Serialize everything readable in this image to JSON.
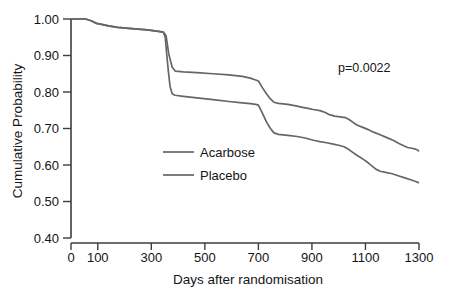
{
  "chart_data": {
    "type": "line",
    "title": "",
    "xlabel": "Days after randomisation",
    "ylabel": "Cumulative Probability",
    "xlim": [
      0,
      1300
    ],
    "ylim": [
      0.4,
      1.0
    ],
    "grid": false,
    "legend_position": "center-left-inside",
    "x_ticks": [
      0,
      100,
      300,
      500,
      700,
      900,
      1100,
      1300
    ],
    "x_tick_labels": [
      "0",
      "100",
      "300",
      "500",
      "700",
      "900",
      "1100",
      "1300"
    ],
    "y_ticks": [
      0.4,
      0.5,
      0.6,
      0.7,
      0.8,
      0.9,
      1.0
    ],
    "y_tick_labels": [
      "0.40",
      "0.50",
      "0.60",
      "0.70",
      "0.80",
      "0.90",
      "1.00"
    ],
    "annotations": [
      {
        "name": "p-value",
        "text": "p=0.0022",
        "x": 1010,
        "y": 0.885
      }
    ],
    "series": [
      {
        "name": "Acarbose",
        "color": "#666666",
        "points": [
          [
            0,
            1.0
          ],
          [
            55,
            1.0
          ],
          [
            75,
            0.995
          ],
          [
            95,
            0.988
          ],
          [
            110,
            0.986
          ],
          [
            140,
            0.981
          ],
          [
            175,
            0.977
          ],
          [
            205,
            0.975
          ],
          [
            250,
            0.972
          ],
          [
            285,
            0.97
          ],
          [
            320,
            0.967
          ],
          [
            345,
            0.964
          ],
          [
            355,
            0.955
          ],
          [
            365,
            0.905
          ],
          [
            378,
            0.868
          ],
          [
            390,
            0.857
          ],
          [
            420,
            0.855
          ],
          [
            470,
            0.853
          ],
          [
            530,
            0.85
          ],
          [
            590,
            0.847
          ],
          [
            640,
            0.843
          ],
          [
            670,
            0.838
          ],
          [
            690,
            0.833
          ],
          [
            700,
            0.83
          ],
          [
            715,
            0.812
          ],
          [
            730,
            0.795
          ],
          [
            745,
            0.781
          ],
          [
            758,
            0.772
          ],
          [
            775,
            0.769
          ],
          [
            810,
            0.766
          ],
          [
            840,
            0.762
          ],
          [
            865,
            0.758
          ],
          [
            885,
            0.755
          ],
          [
            905,
            0.752
          ],
          [
            930,
            0.749
          ],
          [
            950,
            0.744
          ],
          [
            965,
            0.738
          ],
          [
            985,
            0.734
          ],
          [
            1005,
            0.732
          ],
          [
            1025,
            0.73
          ],
          [
            1040,
            0.724
          ],
          [
            1055,
            0.716
          ],
          [
            1070,
            0.709
          ],
          [
            1090,
            0.703
          ],
          [
            1110,
            0.697
          ],
          [
            1130,
            0.69
          ],
          [
            1155,
            0.683
          ],
          [
            1180,
            0.675
          ],
          [
            1205,
            0.667
          ],
          [
            1225,
            0.659
          ],
          [
            1245,
            0.652
          ],
          [
            1258,
            0.648
          ],
          [
            1272,
            0.646
          ],
          [
            1285,
            0.644
          ],
          [
            1295,
            0.641
          ],
          [
            1300,
            0.637
          ]
        ]
      },
      {
        "name": "Placebo",
        "color": "#666666",
        "points": [
          [
            0,
            1.0
          ],
          [
            55,
            1.0
          ],
          [
            75,
            0.995
          ],
          [
            95,
            0.988
          ],
          [
            110,
            0.986
          ],
          [
            140,
            0.981
          ],
          [
            175,
            0.977
          ],
          [
            205,
            0.975
          ],
          [
            250,
            0.972
          ],
          [
            285,
            0.97
          ],
          [
            320,
            0.967
          ],
          [
            345,
            0.964
          ],
          [
            352,
            0.95
          ],
          [
            358,
            0.9
          ],
          [
            364,
            0.855
          ],
          [
            370,
            0.815
          ],
          [
            378,
            0.795
          ],
          [
            388,
            0.791
          ],
          [
            420,
            0.788
          ],
          [
            470,
            0.784
          ],
          [
            530,
            0.779
          ],
          [
            590,
            0.774
          ],
          [
            640,
            0.77
          ],
          [
            670,
            0.768
          ],
          [
            690,
            0.766
          ],
          [
            700,
            0.764
          ],
          [
            715,
            0.742
          ],
          [
            730,
            0.718
          ],
          [
            745,
            0.7
          ],
          [
            758,
            0.688
          ],
          [
            775,
            0.684
          ],
          [
            810,
            0.681
          ],
          [
            845,
            0.678
          ],
          [
            875,
            0.674
          ],
          [
            895,
            0.67
          ],
          [
            910,
            0.667
          ],
          [
            930,
            0.664
          ],
          [
            955,
            0.661
          ],
          [
            980,
            0.657
          ],
          [
            1000,
            0.654
          ],
          [
            1020,
            0.65
          ],
          [
            1035,
            0.644
          ],
          [
            1050,
            0.636
          ],
          [
            1065,
            0.628
          ],
          [
            1080,
            0.621
          ],
          [
            1095,
            0.614
          ],
          [
            1110,
            0.606
          ],
          [
            1125,
            0.597
          ],
          [
            1140,
            0.588
          ],
          [
            1155,
            0.583
          ],
          [
            1175,
            0.58
          ],
          [
            1200,
            0.576
          ],
          [
            1225,
            0.57
          ],
          [
            1250,
            0.564
          ],
          [
            1272,
            0.559
          ],
          [
            1290,
            0.554
          ],
          [
            1300,
            0.551
          ]
        ]
      }
    ]
  },
  "legend": {
    "items": [
      {
        "label": "Acarbose",
        "color": "#666666"
      },
      {
        "label": "Placebo",
        "color": "#666666"
      }
    ]
  },
  "axes": {
    "x_title": "Days after randomisation",
    "y_title": "Cumulative Probability"
  },
  "annotation": {
    "p_value": "p=0.0022"
  }
}
